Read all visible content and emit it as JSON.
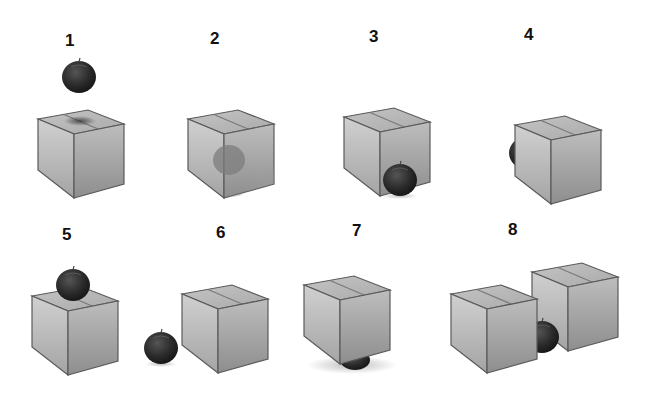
{
  "figure": {
    "colors": {
      "box_light": "#c9c9c9",
      "box_mid": "#a8a8a8",
      "box_dark": "#8a8a8a",
      "box_edge": "#5a5a5a",
      "apple": "#2b2b2b",
      "apple_highlight": "#5a5a5a",
      "label": "#111111",
      "background": "#ffffff"
    },
    "panels": [
      {
        "label": "1",
        "scene": "apple above box, shadow on lid"
      },
      {
        "label": "2",
        "scene": "apple inside transparent box"
      },
      {
        "label": "3",
        "scene": "apple in front of box"
      },
      {
        "label": "4",
        "scene": "apple behind box, partially visible at left"
      },
      {
        "label": "5",
        "scene": "apple on top of box"
      },
      {
        "label": "6",
        "scene": "apple to the left of box"
      },
      {
        "label": "7",
        "scene": "apple under box"
      },
      {
        "label": "8",
        "scene": "apple between two boxes"
      }
    ]
  }
}
